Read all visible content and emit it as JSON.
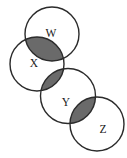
{
  "figure": {
    "kind": "venn-diagram",
    "title": "",
    "background_color": "#ffffff",
    "width": 127,
    "height": 158
  },
  "style": {
    "stroke_color": "#2b2b2b",
    "stroke_width": 1.4,
    "circle_fill": "#ffffff",
    "intersection_fill": "#6a6a6a",
    "label_color": "#1a1a1a",
    "label_font_size": 11.5
  },
  "sets": [
    {
      "id": "W",
      "label": "W",
      "cx": 52,
      "cy": 34,
      "r": 27,
      "label_x": 51,
      "label_y": 34.5
    },
    {
      "id": "X",
      "label": "X",
      "cx": 37,
      "cy": 64,
      "r": 27,
      "label_x": 34,
      "label_y": 64.5
    },
    {
      "id": "Y",
      "label": "Y",
      "cx": 68,
      "cy": 96,
      "r": 27.5,
      "label_x": 66,
      "label_y": 103
    },
    {
      "id": "Z",
      "label": "Z",
      "cx": 97,
      "cy": 124,
      "r": 27,
      "label_x": 103,
      "label_y": 130
    }
  ],
  "intersections": [
    {
      "id": "W-X",
      "sets": "W ∩ X",
      "shaded": true,
      "fill": "#6a6a6a"
    },
    {
      "id": "X-Y",
      "sets": "X ∩ Y",
      "shaded": true,
      "fill": "#6a6a6a"
    },
    {
      "id": "Y-Z",
      "sets": "Y ∩ Z",
      "shaded": true,
      "fill": "#6a6a6a"
    }
  ],
  "chart_data": {
    "type": "diagram",
    "subtype": "venn",
    "title": "",
    "categories": [
      "W",
      "X",
      "Y",
      "Z"
    ],
    "shaded_regions": [
      "W ∩ X",
      "X ∩ Y",
      "Y ∩ Z"
    ],
    "note": "Four circles arranged in a descending diagonal chain; each consecutive pair overlaps and the lens-shaped pairwise intersection is shaded gray."
  }
}
